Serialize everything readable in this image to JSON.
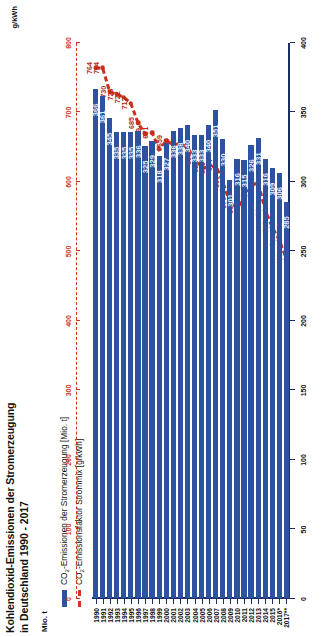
{
  "chart": {
    "title_line1": "Kohlendioxid-Emissionen der Stromerzeugung",
    "title_line2": "in Deutschland 1990 - 2017",
    "unit_left": "Mio. t",
    "unit_right": "g/kWh"
  },
  "legend": {
    "items": [
      {
        "marker": "bar-swatch",
        "pre": "CO",
        "sub": "2",
        "post": "-Emissionen der Stromerzeugung [Mio. t]"
      },
      {
        "marker": "dashed-line-swatch",
        "pre": "CO",
        "sub": "2",
        "post": "-Emissionsfaktor Strommix [g/kWh]"
      }
    ]
  },
  "chart_data": {
    "type": "bar",
    "title": "Kohlendioxid-Emissionen der Stromerzeugung in Deutschland 1990 - 2017",
    "xlabel": "",
    "ylabel": "Mio. t",
    "ylim": [
      0,
      400
    ],
    "yticks": [
      0,
      50,
      100,
      150,
      200,
      250,
      300,
      350,
      400
    ],
    "grid": false,
    "legend_position": "top-left",
    "categories": [
      "1990",
      "1991",
      "1992",
      "1993",
      "1994",
      "1995",
      "1996",
      "1997",
      "1998",
      "1999",
      "2000",
      "2001",
      "2002",
      "2003",
      "2004",
      "2005",
      "2006",
      "2007",
      "2008",
      "2009",
      "2010",
      "2011",
      "2012",
      "2013",
      "2014",
      "2015",
      "2016*",
      "2017**"
    ],
    "series": [
      {
        "name": "CO2-Emissionen der Stromerzeugung [Mio. t]",
        "unit": "Mio. t",
        "color": "#2c52a0",
        "axis": "primary",
        "values": [
          366,
          361,
          345,
          335,
          335,
          335,
          336,
          325,
          329,
          318,
          327,
          336,
          338,
          340,
          333,
          333,
          340,
          351,
          330,
          301,
          316,
          315,
          326,
          331,
          316,
          309,
          306,
          285
        ]
      },
      {
        "name": "CO2-Emissionsfaktor Strommix [g/kWh]",
        "unit": "g/kWh",
        "color": "#c9301c",
        "axis": "secondary",
        "secondary_ylim": [
          0,
          800
        ],
        "secondary_yticks": [
          0,
          100,
          200,
          300,
          400,
          500,
          600,
          700,
          800
        ],
        "values": [
          764,
          764,
          730,
          726,
          722,
          713,
          685,
          669,
          671,
          647,
          659,
          654,
          655,
          650,
          633,
          622,
          620,
          624,
          600,
          570,
          563,
          575,
          595,
          599,
          559,
          535,
          516,
          489
        ]
      }
    ]
  }
}
